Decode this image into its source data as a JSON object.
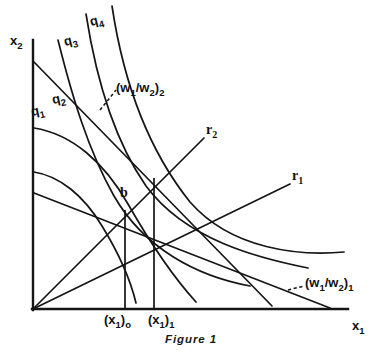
{
  "figure": {
    "caption": "Figure 1",
    "axes": {
      "y_label": "x",
      "y_label_sub": "2",
      "x_label": "x",
      "x_label_sub": "1",
      "origin": [
        32,
        310
      ],
      "x_axis_end": [
        348,
        310
      ],
      "y_axis_top": [
        32,
        40
      ]
    },
    "isoquant_labels": [
      {
        "name": "q1",
        "base": "q",
        "sub": "1",
        "x": 32,
        "y": 116
      },
      {
        "name": "q2",
        "base": "q",
        "sub": "2",
        "x": 54,
        "y": 104
      },
      {
        "name": "q3",
        "base": "q",
        "sub": "3",
        "x": 66,
        "y": 46
      },
      {
        "name": "q4",
        "base": "q",
        "sub": "4",
        "x": 92,
        "y": 26
      }
    ],
    "ray_labels": [
      {
        "name": "r2",
        "base": "r",
        "sub": "2",
        "x": 206,
        "y": 134
      },
      {
        "name": "r1",
        "base": "r",
        "sub": "1",
        "x": 292,
        "y": 180
      }
    ],
    "price_ratio_labels": [
      {
        "name": "w-ratio-2",
        "text": "(w",
        "sub1": "1",
        "mid": "/w",
        "sub2": "2",
        "close": ")",
        "outer_sub": "2",
        "x": 116,
        "y": 92
      },
      {
        "name": "w-ratio-1",
        "text": "(w",
        "sub1": "1",
        "mid": "/w",
        "sub2": "2",
        "close": ")",
        "outer_sub": "1",
        "x": 305,
        "y": 287
      }
    ],
    "point_labels": [
      {
        "name": "point-b",
        "text": "b",
        "x": 122,
        "y": 196
      }
    ],
    "tick_labels": [
      {
        "name": "x1-zero",
        "open": "(x",
        "sub": "1",
        "close": ")",
        "outer": "o",
        "x": 108,
        "y": 326
      },
      {
        "name": "x1-one",
        "open": "(x",
        "sub": "1",
        "close": ")",
        "outer": "1",
        "x": 152,
        "y": 326
      }
    ],
    "droplines": [
      {
        "name": "dropline-x1-zero",
        "x": 125,
        "y_top": 210,
        "y_bottom": 310
      },
      {
        "name": "dropline-x1-one",
        "x": 154,
        "y_top": 178,
        "y_bottom": 310
      }
    ],
    "colors": {
      "ink": "#151515",
      "background": "#ffffff"
    }
  }
}
